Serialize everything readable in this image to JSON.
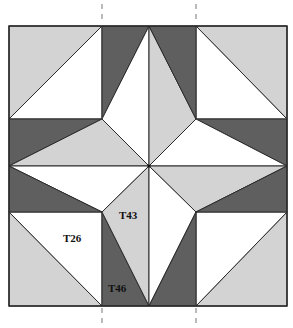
{
  "diagram": {
    "type": "quilt-block",
    "colors": {
      "dark": "#5f5f5f",
      "light": "#d3d3d3",
      "white": "#ffffff",
      "stroke": "#2a2a2a",
      "dash": "#777777"
    },
    "labels": [
      {
        "id": "T26",
        "text": "T26",
        "x": 63,
        "y": 242
      },
      {
        "id": "T43",
        "text": "T43",
        "x": 119,
        "y": 219
      },
      {
        "id": "T46",
        "text": "T46",
        "x": 108,
        "y": 292
      }
    ],
    "cut_lines": [
      {
        "x": 102
      },
      {
        "x": 196
      }
    ]
  }
}
